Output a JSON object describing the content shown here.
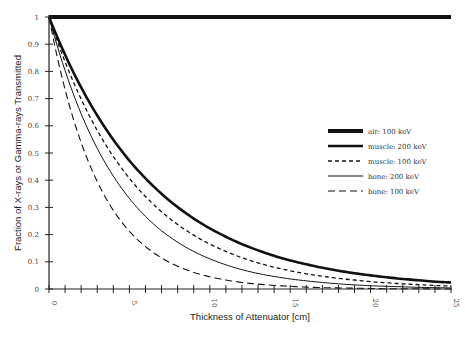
{
  "chart_data": {
    "type": "line",
    "title": "",
    "xlabel": "Thickness of Attenuator [cm]",
    "ylabel": "Fraction of X-rays or Gamma-rays Transmitted",
    "xlim": [
      0,
      25
    ],
    "ylim": [
      0,
      1
    ],
    "x_tick_labels": [
      "0",
      "5",
      "10",
      "15",
      "20",
      "25"
    ],
    "x_minor_tick_step": 1,
    "y_tick_labels": [
      "0",
      "0.1",
      "0.2",
      "0.3",
      "0.4",
      "0.5",
      "0.6",
      "0.7",
      "0.8",
      "0.9",
      "1"
    ],
    "grid": false,
    "legend_position": "right-middle",
    "x": [
      0,
      1,
      2,
      3,
      4,
      5,
      6,
      7,
      8,
      9,
      10,
      11,
      12,
      13,
      14,
      15,
      16,
      17,
      18,
      19,
      20,
      21,
      22,
      23,
      24,
      25
    ],
    "series": [
      {
        "name": "air: 100 keV",
        "style": "heavy-solid",
        "values": [
          1,
          1,
          1,
          1,
          1,
          1,
          1,
          1,
          1,
          1,
          1,
          1,
          1,
          1,
          1,
          1,
          1,
          1,
          1,
          1,
          1,
          1,
          1,
          1,
          1,
          1
        ]
      },
      {
        "name": "muscle: 200 keV",
        "style": "thick-solid",
        "values": [
          1,
          0.861,
          0.741,
          0.638,
          0.549,
          0.472,
          0.407,
          0.35,
          0.301,
          0.259,
          0.223,
          0.192,
          0.165,
          0.142,
          0.122,
          0.105,
          0.091,
          0.078,
          0.067,
          0.058,
          0.05,
          0.043,
          0.037,
          0.032,
          0.027,
          0.024
        ]
      },
      {
        "name": "muscle: 100 keV",
        "style": "short-dash",
        "values": [
          1,
          0.835,
          0.698,
          0.583,
          0.487,
          0.407,
          0.34,
          0.284,
          0.237,
          0.198,
          0.165,
          0.138,
          0.115,
          0.096,
          0.08,
          0.067,
          0.056,
          0.047,
          0.039,
          0.033,
          0.027,
          0.023,
          0.019,
          0.016,
          0.013,
          0.011
        ]
      },
      {
        "name": "bone: 200 keV",
        "style": "thin-solid",
        "values": [
          1,
          0.803,
          0.644,
          0.517,
          0.415,
          0.333,
          0.267,
          0.214,
          0.172,
          0.138,
          0.111,
          0.089,
          0.071,
          0.057,
          0.046,
          0.037,
          0.03,
          0.024,
          0.019,
          0.015,
          0.012,
          0.01,
          0.008,
          0.006,
          0.005,
          0.004
        ]
      },
      {
        "name": "bone: 100 keV",
        "style": "long-dash",
        "values": [
          1,
          0.733,
          0.538,
          0.395,
          0.289,
          0.212,
          0.156,
          0.114,
          0.084,
          0.061,
          0.045,
          0.033,
          0.024,
          0.018,
          0.013,
          0.01,
          0.007,
          0.005,
          0.004,
          0.003,
          0.002,
          0.001,
          0.001,
          0.001,
          0.0,
          0.0
        ]
      }
    ]
  },
  "colors": {
    "line": "#111111",
    "axis": "#222222",
    "text": "#444444",
    "background": "#ffffff"
  }
}
